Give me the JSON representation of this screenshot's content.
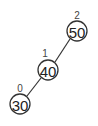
{
  "diagram": {
    "type": "binary-tree",
    "nodes": [
      {
        "id": "n50",
        "value": "50",
        "height": "2",
        "cx": 77,
        "cy": 31
      },
      {
        "id": "n40",
        "value": "40",
        "height": "1",
        "cx": 48,
        "cy": 70
      },
      {
        "id": "n30",
        "value": "30",
        "height": "0",
        "cx": 20,
        "cy": 104
      }
    ],
    "edges": [
      {
        "from": "n50",
        "to": "n40"
      },
      {
        "from": "n40",
        "to": "n30"
      }
    ],
    "colors": {
      "stroke": "#333333",
      "background": "#ffffff"
    }
  }
}
